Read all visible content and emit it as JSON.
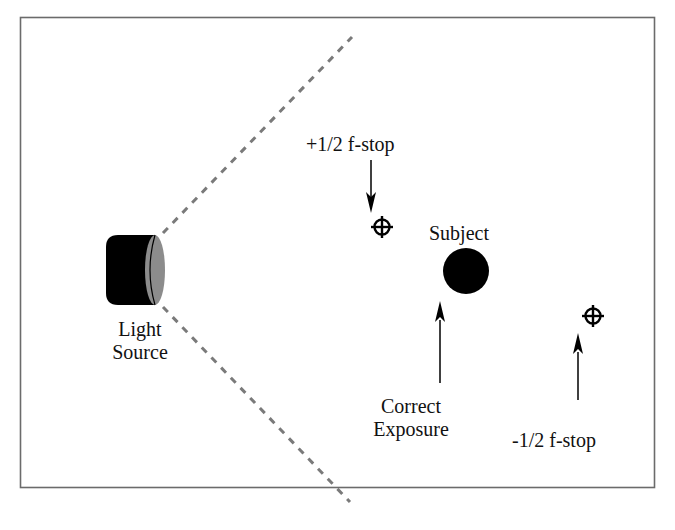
{
  "diagram": {
    "labels": {
      "light_source_line1": "Light",
      "light_source_line2": "Source",
      "plus_half_stop": "+1/2 f-stop",
      "subject": "Subject",
      "correct_exposure_line1": "Correct",
      "correct_exposure_line2": "Exposure",
      "minus_half_stop": "-1/2 f-stop"
    },
    "colors": {
      "frame": "#6b6b6b",
      "dashed_beam": "#7a7a7a",
      "light_body": "#000000",
      "light_face": "#8c8c8c",
      "subject": "#000000",
      "text": "#111111"
    },
    "icons": {
      "light_source": "cylinder-light-icon",
      "plus_marker": "crosshair-icon",
      "minus_marker": "crosshair-icon",
      "subject": "filled-circle-icon"
    }
  }
}
